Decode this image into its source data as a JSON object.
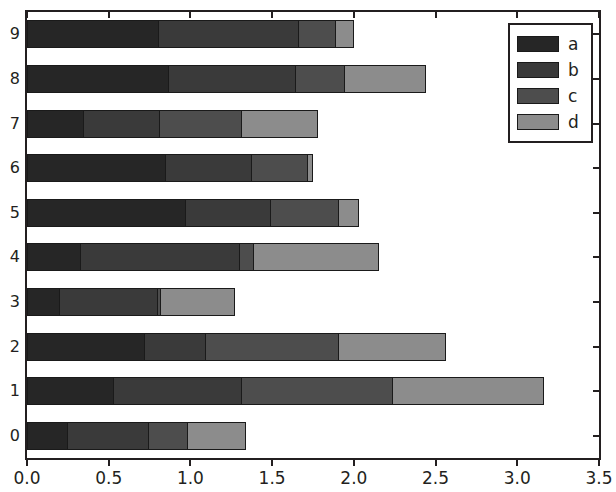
{
  "chart_data": {
    "type": "bar",
    "orientation": "horizontal",
    "stacked": true,
    "title": "",
    "xlabel": "",
    "ylabel": "",
    "xlim": [
      0.0,
      3.5
    ],
    "xticks": [
      "0.0",
      "0.5",
      "1.0",
      "1.5",
      "2.0",
      "2.5",
      "3.0",
      "3.5"
    ],
    "xtick_values": [
      0.0,
      0.5,
      1.0,
      1.5,
      2.0,
      2.5,
      3.0,
      3.5
    ],
    "categories": [
      "0",
      "1",
      "2",
      "3",
      "4",
      "5",
      "6",
      "7",
      "8",
      "9"
    ],
    "grid": false,
    "legend_position": "upper right",
    "series": [
      {
        "name": "a",
        "color": "#262626",
        "values": [
          0.25,
          0.53,
          0.72,
          0.2,
          0.33,
          0.97,
          0.85,
          0.35,
          0.87,
          0.81
        ]
      },
      {
        "name": "b",
        "color": "#3a3a3a",
        "values": [
          0.5,
          0.79,
          0.38,
          0.61,
          0.98,
          0.53,
          0.53,
          0.47,
          0.78,
          0.86
        ]
      },
      {
        "name": "c",
        "color": "#4d4d4d",
        "values": [
          0.25,
          0.93,
          0.82,
          0.02,
          0.09,
          0.42,
          0.35,
          0.51,
          0.31,
          0.23
        ]
      },
      {
        "name": "d",
        "color": "#8c8c8c",
        "values": [
          0.36,
          0.93,
          0.66,
          0.46,
          0.77,
          0.13,
          0.04,
          0.47,
          0.5,
          0.12
        ]
      }
    ],
    "totals": [
      1.36,
      3.18,
      2.58,
      1.29,
      2.17,
      2.05,
      1.77,
      1.8,
      2.46,
      2.02
    ]
  },
  "legend": {
    "entries": [
      {
        "label": "a"
      },
      {
        "label": "b"
      },
      {
        "label": "c"
      },
      {
        "label": "d"
      }
    ]
  },
  "colors": {
    "axis": "#231f20",
    "background": "#ffffff",
    "segment_border": "#1a1a1a"
  }
}
